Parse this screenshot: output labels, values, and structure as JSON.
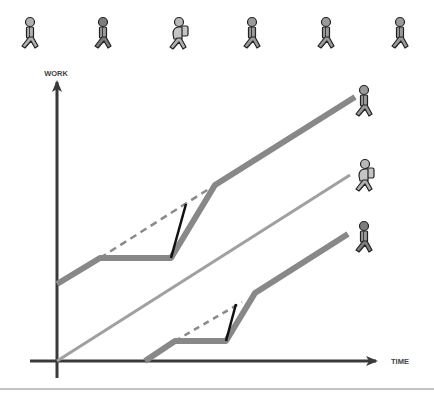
{
  "diagram": {
    "title": "",
    "axes": {
      "y_label": "WORK",
      "x_label": "TIME"
    },
    "colors": {
      "axis": "#3a3a3a",
      "thick_line": "#888888",
      "thin_line": "#a0a0a0",
      "dashed_line": "#8a8a8a",
      "jump_segment": "#111111",
      "figure_fill": "#9a9a9a",
      "figure_outline": "#222222",
      "backpack_fill": "#c4c4c4",
      "footer_rule": "#888888"
    },
    "top_figures": [
      {
        "id": 1,
        "type": "walker",
        "shade": "light"
      },
      {
        "id": 2,
        "type": "walker",
        "shade": "dark"
      },
      {
        "id": 3,
        "type": "walker-with-backpack",
        "shade": "light"
      },
      {
        "id": 4,
        "type": "walker",
        "shade": "mid"
      },
      {
        "id": 5,
        "type": "walker",
        "shade": "mid"
      },
      {
        "id": 6,
        "type": "walker",
        "shade": "mid"
      }
    ],
    "lines": [
      {
        "name": "upper-path",
        "style": "thick",
        "points": [
          [
            57,
            284
          ],
          [
            100,
            258
          ],
          [
            171,
            258
          ],
          [
            215,
            185
          ],
          [
            355,
            97
          ]
        ],
        "end_figure": "walker"
      },
      {
        "name": "middle-path",
        "style": "thin",
        "points": [
          [
            57,
            361
          ],
          [
            350,
            175
          ]
        ],
        "end_figure": "walker-with-backpack"
      },
      {
        "name": "lower-path",
        "style": "thick",
        "points": [
          [
            145,
            361
          ],
          [
            175,
            341
          ],
          [
            226,
            341
          ],
          [
            255,
            293
          ],
          [
            348,
            234
          ]
        ],
        "end_figure": "walker"
      }
    ],
    "dashed_projections": [
      {
        "name": "upper-dashed",
        "points": [
          [
            100,
            258
          ],
          [
            215,
            185
          ]
        ]
      },
      {
        "name": "lower-dashed",
        "points": [
          [
            175,
            341
          ],
          [
            242,
            302
          ]
        ]
      }
    ],
    "jump_segments": [
      {
        "name": "upper-jump",
        "points": [
          [
            171,
            258
          ],
          [
            186,
            204
          ]
        ]
      },
      {
        "name": "lower-jump",
        "points": [
          [
            226,
            341
          ],
          [
            236,
            304
          ]
        ]
      }
    ]
  }
}
